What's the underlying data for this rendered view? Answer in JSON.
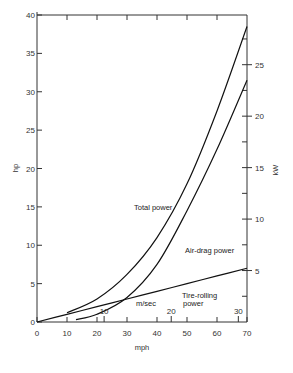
{
  "chart_data": {
    "type": "line",
    "title": "",
    "xlabel": "mph",
    "ylabel": "hp",
    "y2label": "kW",
    "x2label": "m/sec",
    "xlim": [
      0,
      70
    ],
    "ylim": [
      0,
      40
    ],
    "x_ticks": [
      "0",
      "10",
      "20",
      "30",
      "40",
      "50",
      "60",
      "70"
    ],
    "y_ticks": [
      "0",
      "5",
      "10",
      "15",
      "20",
      "25",
      "30",
      "35",
      "40"
    ],
    "y2_ticks": [
      "5",
      "10",
      "15",
      "20",
      "25"
    ],
    "x2_ticks": [
      "10",
      "20",
      "30"
    ],
    "grid": false,
    "legend": "inline annotations",
    "series": [
      {
        "name": "Total power",
        "x": [
          10,
          20,
          30,
          40,
          50,
          60,
          70
        ],
        "values": [
          1.2,
          3.0,
          6.2,
          11.0,
          18.0,
          27.5,
          38.5
        ]
      },
      {
        "name": "Air-drag power",
        "x": [
          13,
          20,
          30,
          40,
          50,
          60,
          70
        ],
        "values": [
          0.3,
          1.0,
          3.2,
          7.5,
          14.5,
          22.5,
          31.5
        ]
      },
      {
        "name": "Tire-rolling power",
        "x": [
          0,
          10,
          20,
          30,
          40,
          50,
          60,
          70
        ],
        "values": [
          0,
          1.0,
          2.0,
          3.0,
          4.0,
          5.0,
          6.0,
          7.0
        ]
      }
    ]
  },
  "labels": {
    "ylabel": "hp",
    "y2label": "kW",
    "xlabel": "mph",
    "x2label": "m/sec",
    "total": "Total power",
    "air": "Air-drag power",
    "tire1": "Tire-rolling",
    "tire2": "power"
  }
}
